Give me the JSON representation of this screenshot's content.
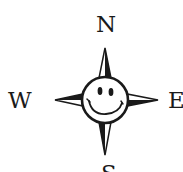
{
  "compass": {
    "north": "N",
    "south": "S",
    "east": "E",
    "west": "W",
    "center_icon": "smiley-face-icon",
    "stroke_color": "#1a1a1a",
    "background": "#ffffff"
  }
}
